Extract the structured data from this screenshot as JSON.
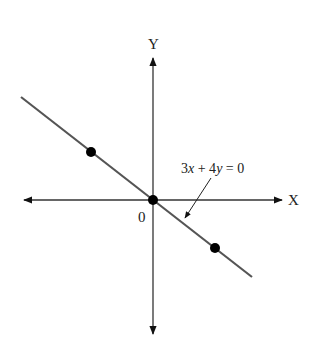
{
  "diagram": {
    "type": "line-graph",
    "axes": {
      "x_label": "X",
      "y_label": "Y",
      "origin_label": "0"
    },
    "line": {
      "equation": "3x + 4y = 0",
      "eq_parts": [
        "3",
        "x",
        " + 4",
        "y",
        " = 0"
      ],
      "color": "#555555"
    },
    "points": [
      {
        "name": "upper-left-point",
        "px": [
          91,
          152
        ]
      },
      {
        "name": "origin-point",
        "px": [
          153,
          200
        ]
      },
      {
        "name": "lower-right-point",
        "px": [
          215,
          248
        ]
      }
    ]
  }
}
